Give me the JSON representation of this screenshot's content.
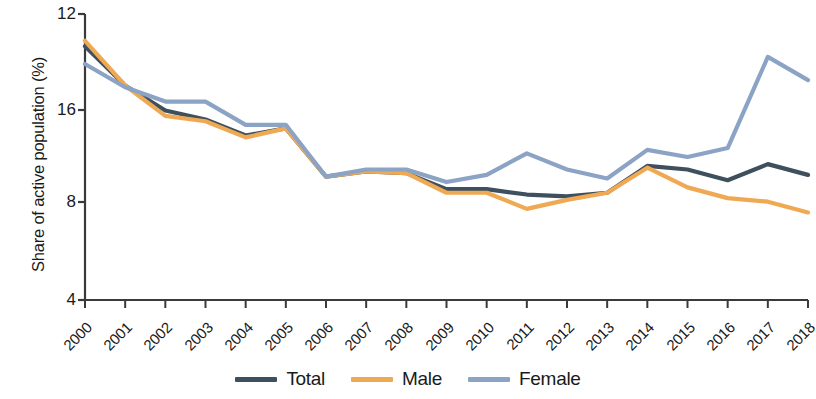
{
  "chart_data": {
    "type": "line",
    "title": "",
    "subtitle": "",
    "xlabel": "",
    "ylabel": "Share of active population (%)",
    "grid": false,
    "legend_position": "bottom-center",
    "x": [
      "2000",
      "2001",
      "2002",
      "2003",
      "2004",
      "2005",
      "2006",
      "2007",
      "2008",
      "2009",
      "2010",
      "2011",
      "2012",
      "2013",
      "2014",
      "2015",
      "2016",
      "2017",
      "2018"
    ],
    "categories": [
      "2000",
      "2001",
      "2002",
      "2003",
      "2004",
      "2005",
      "2006",
      "2007",
      "2008",
      "2009",
      "2010",
      "2011",
      "2012",
      "2013",
      "2014",
      "2015",
      "2016",
      "2017",
      "2018"
    ],
    "ytick_labels": [
      "12",
      "16",
      "8",
      "4"
    ],
    "ytick_positions": [
      14,
      110,
      202,
      300
    ],
    "ylim": [
      4,
      20
    ],
    "series": [
      {
        "name": "Total",
        "color": "#3e4f5e",
        "values": [
          18.2,
          16.0,
          14.6,
          14.1,
          13.2,
          13.6,
          10.9,
          11.2,
          11.1,
          10.2,
          10.2,
          9.9,
          9.8,
          10.0,
          11.5,
          11.3,
          10.7,
          11.6,
          11.0
        ]
      },
      {
        "name": "Male",
        "color": "#f0a953",
        "values": [
          18.5,
          16.0,
          14.3,
          14.0,
          13.1,
          13.6,
          10.9,
          11.2,
          11.1,
          10.0,
          10.0,
          9.1,
          9.6,
          10.0,
          11.4,
          10.3,
          9.7,
          9.5,
          8.9
        ]
      },
      {
        "name": "Female",
        "color": "#8ba3c4",
        "values": [
          17.2,
          15.9,
          15.1,
          15.1,
          13.8,
          13.8,
          10.9,
          11.3,
          11.3,
          10.6,
          11.0,
          12.2,
          11.3,
          10.8,
          12.4,
          12.0,
          12.5,
          17.6,
          16.3
        ]
      }
    ],
    "legend": [
      {
        "label": "Total",
        "color": "#3e4f5e",
        "icon": "line-swatch"
      },
      {
        "label": "Male",
        "color": "#f0a953",
        "icon": "line-swatch"
      },
      {
        "label": "Female",
        "color": "#8ba3c4",
        "icon": "line-swatch"
      }
    ],
    "axis_color": "#3a3a3a"
  }
}
